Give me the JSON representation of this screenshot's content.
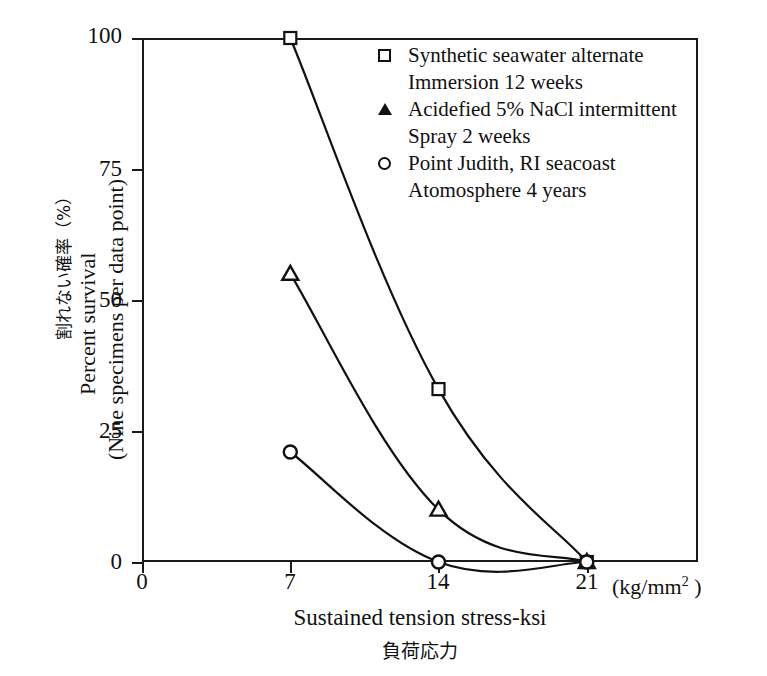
{
  "chart_data": {
    "type": "line",
    "title": "",
    "xlabel": "Sustained tension stress-ksi",
    "xlabel_jp": "負荷応力",
    "x_unit": "(kg/mm",
    "x_unit_sup": "2",
    "x_unit_close": " )",
    "ylabel_line1_jp": "割れない確率（%）",
    "ylabel_line2": "Percent survival",
    "ylabel_line3": "(Nine specimens per data point)",
    "xlim": [
      0,
      26.25
    ],
    "ylim": [
      0,
      100
    ],
    "xticks": [
      0,
      7,
      14,
      21
    ],
    "xtick_labels": [
      "0",
      "7",
      "14",
      "21"
    ],
    "yticks": [
      0,
      25,
      50,
      75,
      100
    ],
    "ytick_labels": [
      "0",
      "25",
      "50",
      "75",
      "100"
    ],
    "grid": false,
    "legend_position": "upper-right-inside",
    "series": [
      {
        "name": "Synthetic seawater alternate Immersion 12 weeks",
        "marker": "open-square",
        "x": [
          7,
          14,
          21
        ],
        "y": [
          100,
          33,
          0
        ]
      },
      {
        "name": "Acidefied 5% NaCl intermittent Spray 2 weeks",
        "marker": "filled-triangle",
        "x": [
          7,
          14,
          21
        ],
        "y": [
          55,
          10,
          0
        ]
      },
      {
        "name": "Point Judith, RI seacoast Atomosphere 4 years",
        "marker": "open-circle",
        "x": [
          7,
          14,
          21
        ],
        "y": [
          21,
          0,
          0
        ]
      }
    ]
  },
  "legend": {
    "entries": [
      {
        "marker": "open-square",
        "line1": "Synthetic seawater alternate",
        "line2": "Immersion 12 weeks"
      },
      {
        "marker": "filled-triangle",
        "line1": "Acidefied 5% NaCl intermittent",
        "line2": "Spray 2 weeks"
      },
      {
        "marker": "open-circle",
        "line1": "Point Judith, RI seacoast",
        "line2": "Atomosphere 4 years"
      }
    ]
  },
  "colors": {
    "axis": "#1a1a1a",
    "curve": "#111111",
    "marker_fill": "#ffffff",
    "background": "#ffffff"
  }
}
